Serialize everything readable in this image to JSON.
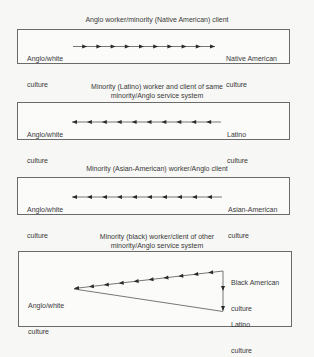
{
  "panels": [
    {
      "title": "Anglo worker/minority (Native American) client",
      "left_label_line1": "Anglo/white",
      "left_label_line2": "culture",
      "right_label_line1": "Native American",
      "right_label_line2": "culture",
      "arrow_direction": "right",
      "arrow_count": 10
    },
    {
      "title_line1": "Minority (Latino) worker and client of same",
      "title_line2": "minority/Anglo service system",
      "left_label_line1": "Anglo/white",
      "left_label_line2": "culture",
      "right_label_line1": "Latino",
      "right_label_line2": "culture",
      "arrow_direction": "left",
      "arrow_count": 10
    },
    {
      "title": "Minority (Asian-American) worker/Anglo client",
      "left_label_line1": "Anglo/white",
      "left_label_line2": "culture",
      "right_label_line1": "Asian-American",
      "right_label_line2": "culture",
      "arrow_direction": "left",
      "arrow_count": 10
    },
    {
      "title_line1": "Minority (black) worker/client of other",
      "title_line2": "minority/Anglo service system",
      "left_label_line1": "Anglo/white",
      "left_label_line2": "culture",
      "top_right_label_line1": "Black American",
      "top_right_label_line2": "culture",
      "bottom_right_label_line1": "Latino",
      "bottom_right_label_line2": "culture",
      "diagonal_arrow_direction": "left",
      "diagonal_arrow_count": 10,
      "vertical_arrow_direction": "down",
      "vertical_arrow_count": 2
    }
  ],
  "colors": {
    "line": "#555555",
    "arrowhead": "#2a2a2a",
    "text": "#3a3a3a",
    "border": "#6a6a6a"
  }
}
